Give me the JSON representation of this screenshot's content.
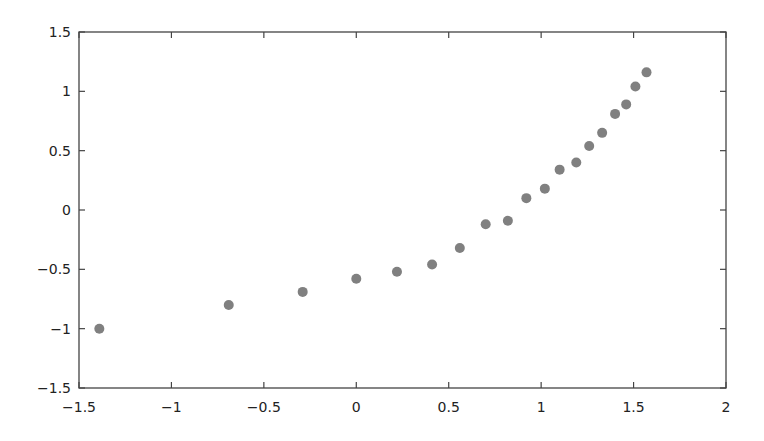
{
  "chart_data": {
    "type": "scatter",
    "title": "",
    "xlabel": "",
    "ylabel": "",
    "xlim": [
      -1.5,
      2
    ],
    "ylim": [
      -1.5,
      1.5
    ],
    "xticks": [
      -1.5,
      -1,
      -0.5,
      0,
      0.5,
      1,
      1.5,
      2
    ],
    "yticks": [
      -1.5,
      -1,
      -0.5,
      0,
      0.5,
      1,
      1.5
    ],
    "xtick_labels": [
      "−1.5",
      "−1",
      "−0.5",
      "0",
      "0.5",
      "1",
      "1.5",
      "2"
    ],
    "ytick_labels": [
      "−1.5",
      "−1",
      "−0.5",
      "0",
      "0.5",
      "1",
      "1.5"
    ],
    "grid": false,
    "legend": "none",
    "marker_color": "#808080",
    "series": [
      {
        "name": "points",
        "x": [
          -1.39,
          -0.69,
          -0.29,
          0.0,
          0.22,
          0.41,
          0.56,
          0.7,
          0.82,
          0.92,
          1.02,
          1.1,
          1.19,
          1.26,
          1.33,
          1.4,
          1.46,
          1.51,
          1.57
        ],
        "y": [
          -1.0,
          -0.8,
          -0.69,
          -0.58,
          -0.52,
          -0.46,
          -0.32,
          -0.12,
          -0.09,
          0.1,
          0.18,
          0.34,
          0.4,
          0.54,
          0.65,
          0.81,
          0.89,
          1.04,
          1.16
        ]
      }
    ]
  }
}
